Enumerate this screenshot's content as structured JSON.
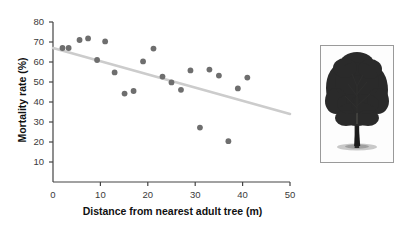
{
  "figure": {
    "tree_photo_alt": "tree-silhouette-photograph"
  },
  "chart_data": {
    "type": "scatter",
    "title": "",
    "xlabel": "Distance from nearest adult tree (m)",
    "ylabel": "Mortality rate (%)",
    "xlim": [
      0,
      50
    ],
    "ylim": [
      0,
      80
    ],
    "xticks": [
      0,
      10,
      20,
      30,
      40,
      50
    ],
    "yticks": [
      10,
      20,
      30,
      40,
      50,
      60,
      70,
      80
    ],
    "grid": false,
    "legend": null,
    "marker_color": "#6e6e6e",
    "trendline_color": "#cccccc",
    "axis_color": "#444444",
    "points": [
      {
        "x": 2.0,
        "y": 67.0
      },
      {
        "x": 3.3,
        "y": 67.0
      },
      {
        "x": 5.6,
        "y": 71.0
      },
      {
        "x": 7.4,
        "y": 71.8
      },
      {
        "x": 9.3,
        "y": 61.0
      },
      {
        "x": 11.0,
        "y": 70.3
      },
      {
        "x": 13.0,
        "y": 54.8
      },
      {
        "x": 15.1,
        "y": 44.2
      },
      {
        "x": 17.0,
        "y": 45.5
      },
      {
        "x": 19.0,
        "y": 60.3
      },
      {
        "x": 21.2,
        "y": 66.7
      },
      {
        "x": 23.1,
        "y": 52.7
      },
      {
        "x": 25.0,
        "y": 49.8
      },
      {
        "x": 27.0,
        "y": 46.1
      },
      {
        "x": 29.0,
        "y": 55.8
      },
      {
        "x": 31.0,
        "y": 27.2
      },
      {
        "x": 33.0,
        "y": 56.2
      },
      {
        "x": 35.0,
        "y": 53.2
      },
      {
        "x": 37.0,
        "y": 20.4
      },
      {
        "x": 39.0,
        "y": 46.8
      },
      {
        "x": 41.0,
        "y": 52.2
      }
    ],
    "trendline": {
      "x_start": 0.0,
      "y_start": 67.0,
      "x_end": 50.0,
      "y_end": 34.0
    }
  }
}
